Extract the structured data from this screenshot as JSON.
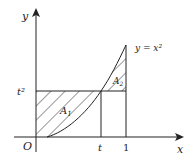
{
  "figure": {
    "axes": {
      "x_label": "x",
      "y_label": "y",
      "origin_label": "O"
    },
    "curve_label": "y = x²",
    "ticks": {
      "x": [
        "t",
        "1"
      ],
      "y": [
        "t²"
      ]
    },
    "regions": [
      {
        "name": "A",
        "subscript": "1",
        "description": "region between y = t² and curve for 0 ≤ x ≤ t"
      },
      {
        "name": "A",
        "subscript": "2",
        "description": "region between curve and y = t² for t ≤ x ≤ 1"
      }
    ],
    "colors": {
      "stroke": "#222222",
      "background": "#ffffff"
    }
  }
}
